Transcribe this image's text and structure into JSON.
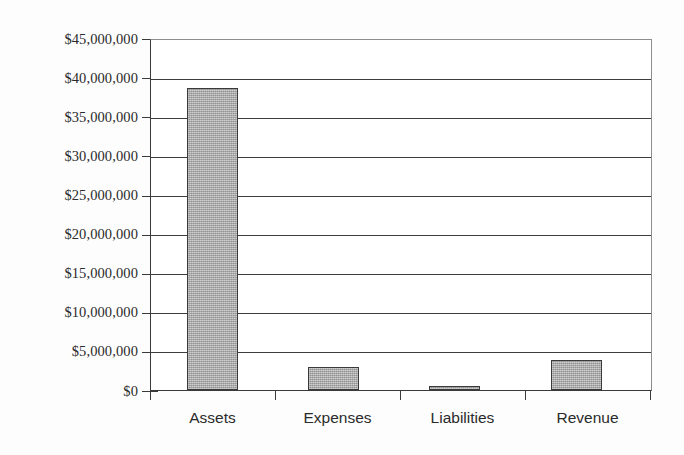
{
  "chart_data": {
    "type": "bar",
    "title": "",
    "subtitle": "",
    "xlabel": "",
    "ylabel": "",
    "categories": [
      "Assets",
      "Expenses",
      "Liabilities",
      "Revenue"
    ],
    "values": [
      38850000,
      3000000,
      300000,
      3800000
    ],
    "ylim": [
      0,
      45000000
    ],
    "ytick_step": 5000000,
    "ytick_labels": [
      "$45,000,000",
      "$40,000,000",
      "$35,000,000",
      "$30,000,000",
      "$25,000,000",
      "$20,000,000",
      "$15,000,000",
      "$10,000,000",
      "$5,000,000",
      "$0"
    ],
    "ytick_values": [
      45000000,
      40000000,
      35000000,
      30000000,
      25000000,
      20000000,
      15000000,
      10000000,
      5000000,
      0
    ],
    "grid": true,
    "grid_orientation": "horizontal",
    "legend": false,
    "legend_position": "none",
    "series": [
      {
        "name": "",
        "values": [
          38850000,
          3000000,
          300000,
          3800000
        ]
      }
    ],
    "annotations": [],
    "colors": {
      "bar_fill": "#a5a5a5",
      "bar_border": "#3a3a3a",
      "gridline": "#3d3d3d",
      "axis": "#3a3a3a",
      "plot_background": "#ffffff",
      "figure_background": "#fdfdfd",
      "text": "#2b2b2b"
    }
  }
}
